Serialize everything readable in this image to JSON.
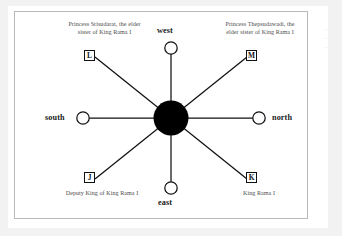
{
  "figure": {
    "type": "radial-star-diagram",
    "center_node": {
      "name": "center-hub",
      "shape": "filled-circle",
      "color": "#000000"
    },
    "directions": [
      {
        "id": "west",
        "label": "west",
        "position": "top"
      },
      {
        "id": "north",
        "label": "north",
        "position": "right"
      },
      {
        "id": "east",
        "label": "east",
        "position": "bottom"
      },
      {
        "id": "south",
        "label": "south",
        "position": "left"
      }
    ],
    "nodes": [
      {
        "id": "L",
        "letter": "L",
        "position": "top-left",
        "caption": [
          "Princess Srisudarat, the elder",
          "sister of King Rama I"
        ]
      },
      {
        "id": "M",
        "letter": "M",
        "position": "top-right",
        "caption": [
          "Princess Thepsudawadi, the",
          "elder sister of King Rama I"
        ]
      },
      {
        "id": "J",
        "letter": "J",
        "position": "bottom-left",
        "caption": [
          "Deputy King of King Rama I"
        ]
      },
      {
        "id": "K",
        "letter": "K",
        "position": "bottom-right",
        "caption": [
          "King Rama I"
        ]
      }
    ],
    "colors": {
      "hub": "#000000",
      "line": "#111111",
      "caption_text": "#4d4d4d",
      "direction_text": "#1a1a1a",
      "frame_border": "#b9b9b9",
      "page_background": "#f2f2f2",
      "sheet": "#ffffff"
    }
  },
  "captions": {
    "L_line1": "Princess Srisudarat, the elder",
    "L_line2": "sister of King Rama I",
    "M_line1": "Princess Thepsudawadi, the",
    "M_line2": "elder sister of King Rama I",
    "J_line1": "Deputy King of King Rama I",
    "K_line1": "King Rama I"
  },
  "labels": {
    "west": "west",
    "north": "north",
    "east": "east",
    "south": "south",
    "L": "L",
    "M": "M",
    "J": "J",
    "K": "K"
  }
}
